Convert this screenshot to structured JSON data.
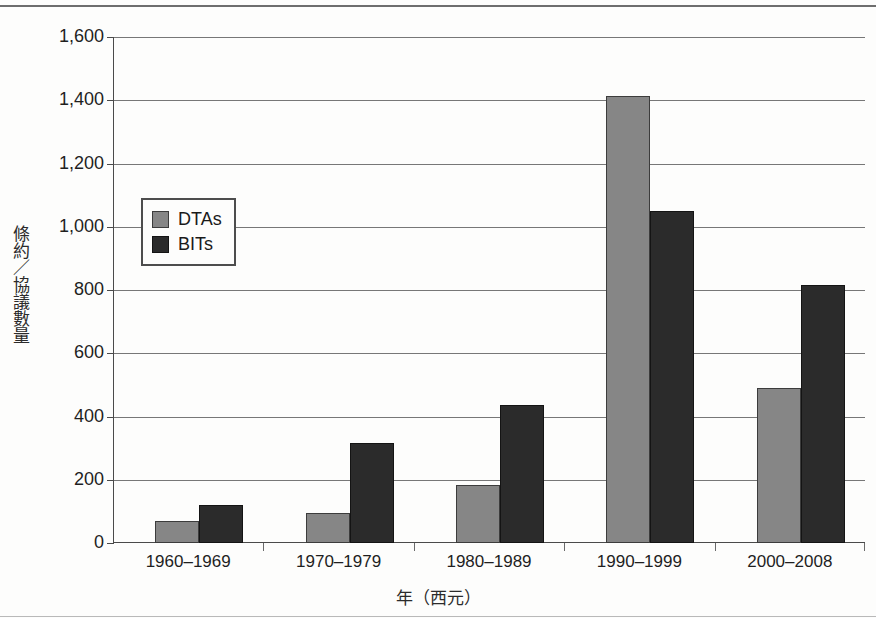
{
  "chart_data": {
    "type": "bar",
    "title": "",
    "xlabel": "年（西元）",
    "ylabel": "條約／協議數量",
    "categories": [
      "1960–1969",
      "1970–1979",
      "1980–1989",
      "1990–1999",
      "2000–2008"
    ],
    "series": [
      {
        "name": "DTAs",
        "color": "#868686",
        "values": [
          70,
          95,
          185,
          1415,
          490
        ]
      },
      {
        "name": "BITs",
        "color": "#2b2b2b",
        "values": [
          120,
          315,
          435,
          1050,
          815
        ]
      }
    ],
    "ylim": [
      0,
      1600
    ],
    "yticks": [
      0,
      200,
      400,
      600,
      800,
      1000,
      1200,
      1400,
      1600
    ],
    "ytick_labels": [
      "0",
      "200",
      "400",
      "600",
      "800",
      "1,000",
      "1,200",
      "1,400",
      "1,600"
    ],
    "grid": true,
    "legend_position": "upper-left-inside"
  }
}
